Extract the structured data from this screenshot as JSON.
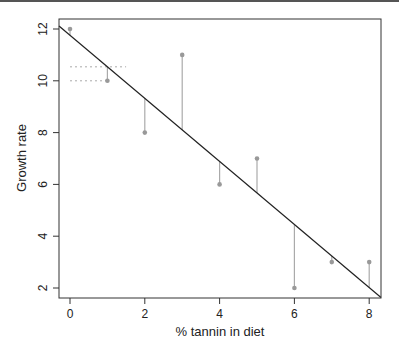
{
  "chart_data": {
    "type": "scatter",
    "title": "",
    "xlabel": "% tannin in diet",
    "ylabel": "Growth rate",
    "x": [
      0,
      1,
      2,
      3,
      4,
      5,
      6,
      7,
      8
    ],
    "y": [
      12,
      10,
      8,
      11,
      6,
      7,
      2,
      3,
      3
    ],
    "xticks": [
      0,
      2,
      4,
      6,
      8
    ],
    "yticks": [
      2,
      4,
      6,
      8,
      10,
      12
    ],
    "xlim": [
      -0.3,
      8.3
    ],
    "ylim": [
      1.6,
      12.4
    ],
    "grid": false,
    "legend": null,
    "regression_line": {
      "intercept": 11.756,
      "slope": -1.217
    },
    "residual_lines": true,
    "annotations": [
      {
        "type": "dotted-hline",
        "y": 10.54,
        "x_from": 0,
        "x_to": 1.5,
        "note": "fitted value at x=1"
      },
      {
        "type": "dotted-hline",
        "y": 10,
        "x_from": 0,
        "x_to": 1,
        "note": "observed value at x=1"
      }
    ],
    "colors": {
      "points": "#999999",
      "residuals": "#aaaaaa",
      "line": "#222222",
      "dotted": "#aaaaaa"
    }
  }
}
